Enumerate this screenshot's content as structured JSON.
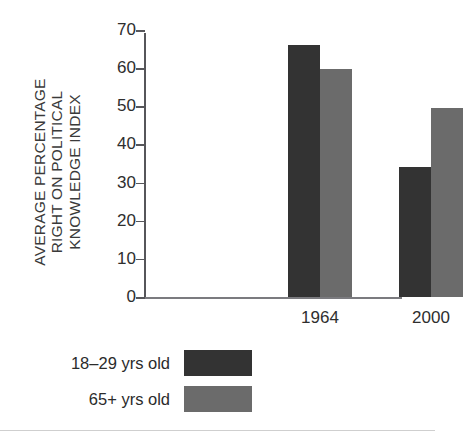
{
  "chart_data": {
    "type": "bar",
    "title": "",
    "subtitle": "",
    "xlabel": "",
    "ylabel": "AVERAGE PERCENTAGE RIGHT ON POLITICAL KNOWLEDGE INDEX",
    "ylabel_lines": [
      "AVERAGE PERCENTAGE",
      "RIGHT ON POLITICAL",
      "KNOWLEDGE INDEX"
    ],
    "categories": [
      "1964",
      "2000"
    ],
    "series": [
      {
        "name": "18–29 yrs old",
        "color": "#333333",
        "values": [
          66,
          34
        ]
      },
      {
        "name": "65+ yrs old",
        "color": "#6b6b6b",
        "values": [
          59.7,
          49.6
        ]
      }
    ],
    "ylim": [
      0,
      70
    ],
    "ytick_values": [
      70,
      60,
      50,
      40,
      30,
      20,
      10,
      0
    ],
    "ytick_labels": [
      "70",
      "60",
      "50",
      "40",
      "30",
      "20",
      "10",
      "0"
    ],
    "grid": false,
    "legend_position": "bottom-left",
    "axis_color": "#56565a"
  },
  "legend": {
    "items": [
      {
        "label": "18–29 yrs old",
        "color": "#333333"
      },
      {
        "label": "65+ yrs old",
        "color": "#6b6b6b"
      }
    ]
  }
}
